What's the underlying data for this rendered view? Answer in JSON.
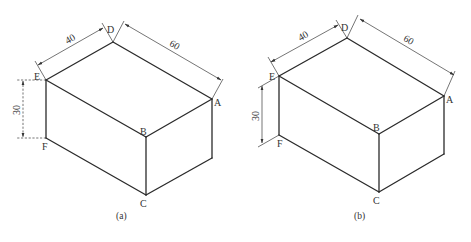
{
  "figures": [
    {
      "id": "a",
      "caption": "(a)",
      "vertices": {
        "A": "A",
        "B": "B",
        "C": "C",
        "D": "D",
        "E": "E",
        "F": "F"
      },
      "dimensions": {
        "width": "40",
        "length": "60",
        "height": "30"
      },
      "height_dimension_style": "dashed"
    },
    {
      "id": "b",
      "caption": "(b)",
      "vertices": {
        "A": "A",
        "B": "B",
        "C": "C",
        "D": "D",
        "E": "E",
        "F": "F"
      },
      "dimensions": {
        "width": "40",
        "length": "60",
        "height": "30"
      },
      "height_dimension_style": "solid"
    }
  ],
  "colors": {
    "line": "#2a2a2a",
    "background": "#ffffff"
  }
}
